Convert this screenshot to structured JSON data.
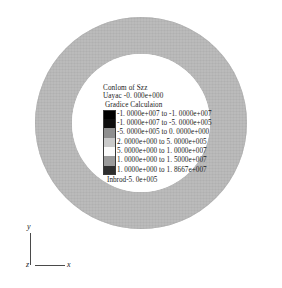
{
  "figure": {
    "type": "contour-plot",
    "geometry": "annulus",
    "background_color": "#ffffff",
    "ring_color": "#b9b9b9"
  },
  "legend": {
    "title": "Conlom of Szz",
    "value_line": "Uayac -0. 000e+000",
    "method_line": "Gradice Calculaion",
    "footer": "Inbrod-5. 0e+005",
    "bands": [
      {
        "color": "#000000",
        "label": "-1. 0000e+007 to -1. 0000e+007"
      },
      {
        "color": "#0d0d0d",
        "label": "-1. 0000e+007 to -5. 0000e+005"
      },
      {
        "color": "#8f8f8f",
        "label": "-5. 0000e+005 to 0. 0000e+000"
      },
      {
        "color": "#c9c9c9",
        "label": "2. 0000e+000 to 5. 0000e+005"
      },
      {
        "color": "#fbfbfb",
        "label": "5. 0000e+000 to 1. 0000e+007"
      },
      {
        "color": "#9a9a9a",
        "label": "1. 0000e+000 to 1. 5000e+007"
      },
      {
        "color": "#2e2e2e",
        "label": "1. 0000e+000 to 1. 8667e+007"
      }
    ]
  },
  "axes": {
    "y_label": "y",
    "z_label": "z",
    "x_label": "x"
  },
  "chart_data": {
    "type": "heatmap",
    "title": "Conlom of Szz",
    "subtitle": "Uayac -0. 000e+000",
    "annotation": "Gradice Calculaion",
    "footer_annotation": "Inbrod-5. 0e+005",
    "xlabel": "x",
    "ylabel": "y",
    "zlabel": "z",
    "grid": false,
    "legend_position": "center",
    "colorbar_orientation": "vertical",
    "colorbar_units": "Pa",
    "geometry": {
      "shape": "annulus",
      "outer_radius_px": 106,
      "inner_radius_px": 69,
      "center_px": [
        141,
        123
      ]
    },
    "categories": [
      "-1. 0000e+007 to -1. 0000e+007",
      "-1. 0000e+007 to -5. 0000e+005",
      "-5. 0000e+005 to 0. 0000e+000",
      "2. 0000e+000 to 5. 0000e+005",
      "5. 0000e+000 to 1. 0000e+007",
      "1. 0000e+000 to 1. 5000e+007",
      "1. 0000e+000 to 1. 8667e+007"
    ],
    "band_lower_bounds": [
      -10000000,
      -10000000,
      -500000,
      2,
      5,
      1,
      1
    ],
    "band_upper_bounds": [
      -10000000,
      -500000,
      0,
      500000,
      10000000,
      15000000,
      18667000
    ],
    "band_colors": [
      "#000000",
      "#0d0d0d",
      "#8f8f8f",
      "#c9c9c9",
      "#fbfbfb",
      "#9a9a9a",
      "#2e2e2e"
    ],
    "values": [
      -10000000,
      -500000,
      0,
      500000,
      10000000,
      15000000,
      18667000
    ],
    "zlim": [
      -10000000,
      18667000
    ],
    "rendered_field_value": "uniform",
    "rendered_field_band_index": 5
  }
}
